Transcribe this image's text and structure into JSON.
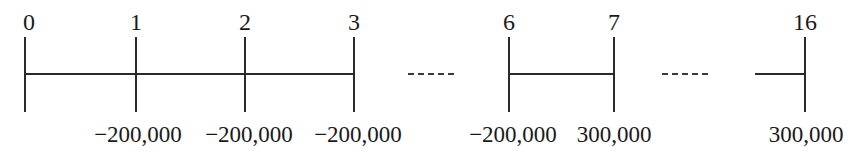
{
  "diagram": {
    "type": "cash-flow-timeline",
    "colors": {
      "line": "#2a2a2a",
      "text": "#1a1a1a",
      "background": "#ffffff"
    },
    "periods": [
      {
        "label": "0",
        "cash_flow": ""
      },
      {
        "label": "1",
        "cash_flow": "−200,000"
      },
      {
        "label": "2",
        "cash_flow": "−200,000"
      },
      {
        "label": "3",
        "cash_flow": "−200,000"
      },
      {
        "label": "6",
        "cash_flow": "−200,000"
      },
      {
        "label": "7",
        "cash_flow": "300,000"
      },
      {
        "label": "16",
        "cash_flow": "300,000"
      }
    ],
    "ellipsis": [
      "-----",
      "-----"
    ]
  }
}
